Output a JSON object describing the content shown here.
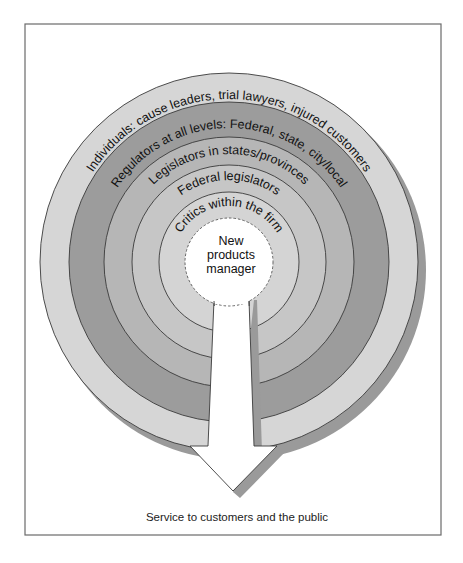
{
  "diagram": {
    "center_label": [
      "New",
      "products",
      "manager"
    ],
    "rings": [
      {
        "label": "Individuals:  cause leaders, trial lawyers, injured customers",
        "color": "#d6d6d6"
      },
      {
        "label": "Regulators at all levels:  Federal, state, city/local",
        "color": "#9c9c9c"
      },
      {
        "label": "Legislators in states/provinces",
        "color": "#b6b6b6"
      },
      {
        "label": "Federal legislators",
        "color": "#c6c6c6"
      },
      {
        "label": "Critics within the firm",
        "color": "#d4d4d4"
      }
    ],
    "arrow_caption": "Service to customers and the public",
    "colors": {
      "shadow": "#9a9a9a",
      "center_fill": "#ffffff",
      "arrow_fill": "#ffffff",
      "frame_stroke": "#6a6a6a"
    }
  }
}
